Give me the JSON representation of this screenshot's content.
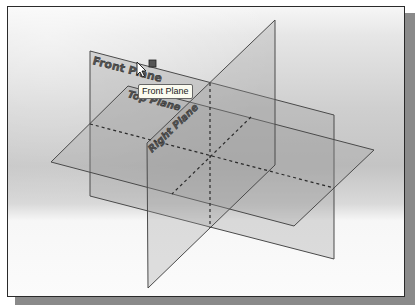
{
  "viewport": {
    "description": "3D CAD graphics area showing default datum planes",
    "background_gradient": [
      "#f6f6f6",
      "#c4c4c4",
      "#fbfbfb"
    ]
  },
  "planes": [
    {
      "name": "Front Plane",
      "label": "Front Plane",
      "points": "89,50 333,114 333,258 89,195"
    },
    {
      "name": "Top Plane",
      "label": "Top Plane",
      "points": "127,85 373,149 293,225 50,161"
    },
    {
      "name": "Right Plane",
      "label": "Right Plane",
      "points": "146,142 274,19 274,164 147,287"
    }
  ],
  "colors": {
    "plane_fill": "#9a9a9a",
    "plane_edge": "#4a4a4a",
    "hidden_line": "#2a2a2a",
    "handle": "#555555"
  },
  "tooltip": {
    "text": "Front Plane"
  },
  "cursor": {
    "type": "arrow-pointer",
    "x": 136,
    "y": 61
  }
}
